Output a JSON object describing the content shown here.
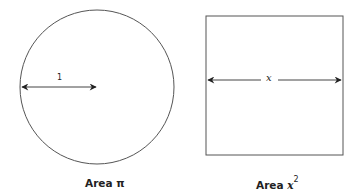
{
  "circle": {
    "radius_label": "1",
    "caption_prefix": "Area ",
    "caption_value": "π"
  },
  "square": {
    "side_label": "x",
    "caption_prefix": "Area ",
    "caption_var": "x",
    "caption_exp": "2"
  },
  "colors": {
    "stroke": "#555555",
    "arrow": "#222222",
    "text": "#222222"
  }
}
